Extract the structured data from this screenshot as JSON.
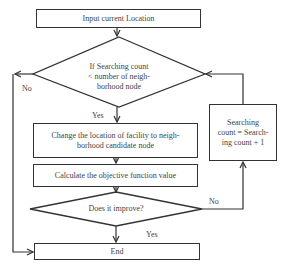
{
  "flowchart": {
    "start_box": {
      "label": "Input current Location"
    },
    "decision_1": {
      "lines": [
        "If Searching count",
        "< number of neigh-",
        "borhood node"
      ]
    },
    "decision_1_no": "No",
    "decision_1_yes": "Yes",
    "change_box": {
      "lines": [
        "Change the location of facility to neigh-",
        "borhood candidate node"
      ]
    },
    "calculate_box": {
      "label": "Calculate the objective function value"
    },
    "decision_2": {
      "label": "Does it improve?"
    },
    "decision_2_no": "No",
    "decision_2_yes": "Yes",
    "increment_box": {
      "lines": [
        "Searching",
        "count = Search-",
        "ing count + 1"
      ]
    },
    "end_box": {
      "label": "End"
    }
  },
  "colors": {
    "stroke": "#333333",
    "text": "#444444",
    "background": "#ffffff"
  }
}
